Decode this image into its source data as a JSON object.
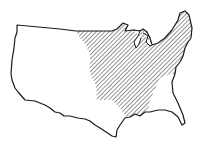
{
  "map": {
    "subject": "Contiguous United States outline",
    "highlighted_region": "Eastern and central United States (hatched)",
    "colors": {
      "background": "#ffffff",
      "outline": "#1a1a1a",
      "hatch": "#2a2a2a"
    }
  }
}
